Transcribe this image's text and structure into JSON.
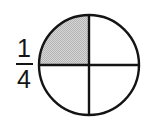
{
  "figure": {
    "background_color": "#ffffff",
    "line_color": "#141414",
    "shade_color": "#c8c8c8",
    "width": 151,
    "height": 128
  },
  "fraction": {
    "numerator": "1",
    "denominator": "4",
    "value_text": "1/4",
    "bar_color": "#141414"
  },
  "chart_data": {
    "type": "pie",
    "title": "",
    "subtitle": "",
    "xlabel": "",
    "ylabel": "",
    "legend_position": "none",
    "grid": false,
    "total_parts": 4,
    "shaded_parts": 1,
    "fraction_numerator": 1,
    "fraction_denominator": 4,
    "fraction_value": 0.25,
    "categories": [
      "top-left",
      "top-right",
      "bottom-left",
      "bottom-right"
    ],
    "values": [
      25,
      25,
      25,
      25
    ],
    "slice_labels": [
      "",
      "",
      "",
      ""
    ],
    "slice_shaded": [
      true,
      false,
      false,
      false
    ],
    "slice_colors": [
      "#c8c8c8",
      "#ffffff",
      "#ffffff",
      "#ffffff"
    ],
    "annotations": [
      "1/4"
    ],
    "center_x": 53,
    "center_y": 59,
    "radius": 50,
    "stroke_color": "#141414",
    "stroke_width": 2.4
  },
  "accessibility": {
    "alt_text": "A circle divided into four equal quarters with the top-left quarter shaded gray, labeled one fourth."
  }
}
